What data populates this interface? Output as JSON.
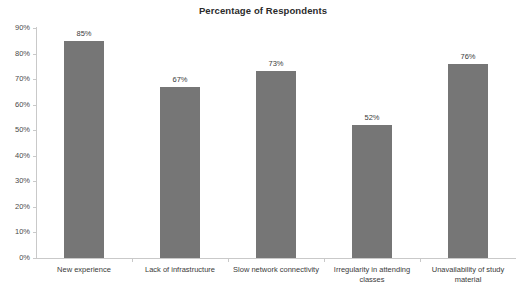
{
  "chart_data": {
    "type": "bar",
    "title": "Percentage of Respondents",
    "xlabel": "",
    "ylabel": "",
    "ylim": [
      0,
      90
    ],
    "ytick_labels": [
      "0%",
      "10%",
      "20%",
      "30%",
      "40%",
      "50%",
      "60%",
      "70%",
      "80%",
      "90%"
    ],
    "ytick_values": [
      0,
      10,
      20,
      30,
      40,
      50,
      60,
      70,
      80,
      90
    ],
    "grid": false,
    "legend": false,
    "bar_color": "#767676",
    "axis_color": "#c9c9c9",
    "background": "#ffffff",
    "categories": [
      "New experience",
      "Lack of infrastructure",
      "Slow network connectivity",
      "Irregularity in attending classes",
      "Unavailability of study material"
    ],
    "values": [
      85,
      67,
      73,
      52,
      76
    ],
    "value_labels": [
      "85%",
      "67%",
      "73%",
      "52%",
      "76%"
    ]
  }
}
